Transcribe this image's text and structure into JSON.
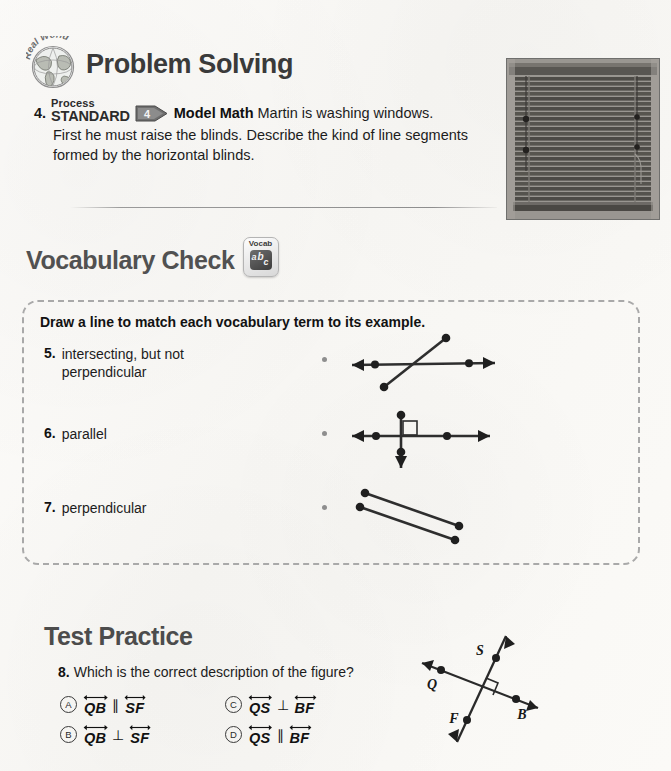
{
  "problem_solving": {
    "title": "Problem Solving",
    "badge_icon": "globe-real-world-icon",
    "badge_text": "Real World",
    "problem": {
      "number": "4.",
      "standard_process_label": "Process",
      "standard_label": "STANDARD",
      "standard_arrow_number": "4",
      "skill": "Model Math",
      "text_first_line": "Martin is washing windows.",
      "text_rest": "First he must raise the blinds. Describe the kind of line segments formed by the horizontal blinds."
    },
    "photo_alt": "horizontal window blinds"
  },
  "vocabulary_check": {
    "title": "Vocabulary Check",
    "badge_label": "Vocab",
    "badge_letters": [
      "a",
      "b",
      "c"
    ],
    "instruction": "Draw a line to match each vocabulary term to its example.",
    "items": [
      {
        "number": "5.",
        "term_line1": "intersecting, but not",
        "term_line2": "perpendicular"
      },
      {
        "number": "6.",
        "term_line1": "parallel",
        "term_line2": ""
      },
      {
        "number": "7.",
        "term_line1": "perpendicular",
        "term_line2": ""
      }
    ],
    "figures": [
      {
        "name": "intersecting-non-perpendicular-figure",
        "description": "a horizontal line with arrows on both ends crossed by a slanted line segment"
      },
      {
        "name": "perpendicular-lines-figure",
        "description": "a horizontal line with arrows crossed by a vertical line with arrows, with a right angle marker"
      },
      {
        "name": "parallel-segments-figure",
        "description": "two parallel slanted line segments with endpoint dots"
      }
    ]
  },
  "test_practice": {
    "title": "Test Practice",
    "question": {
      "number": "8.",
      "text": "Which is the correct description of the figure?"
    },
    "choices": [
      {
        "letter": "A",
        "left": "QB",
        "relation": "∥",
        "right": "SF"
      },
      {
        "letter": "B",
        "left": "QB",
        "relation": "⊥",
        "right": "SF"
      },
      {
        "letter": "C",
        "left": "QS",
        "relation": "⊥",
        "right": "BF"
      },
      {
        "letter": "D",
        "left": "QS",
        "relation": "∥",
        "right": "BF"
      }
    ],
    "figure": {
      "name": "perpendicular-lines-QSBF-figure",
      "point_labels": [
        "S",
        "Q",
        "F",
        "B"
      ],
      "description": "two perpendicular lines through points Q, B and S, F with a right angle marker"
    }
  },
  "colors": {
    "paper": "#fbfaf8",
    "heading_gray": "#4c4c4c",
    "ink": "#1c1c1c",
    "dashed_border": "#a9a9a9",
    "dot_gray": "#8e8e8e"
  }
}
